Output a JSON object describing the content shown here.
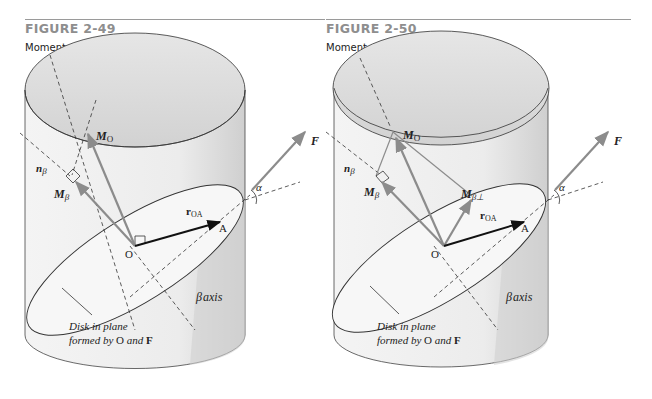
{
  "figures": [
    {
      "number": "FIGURE 2-49",
      "caption_prefix": "Moment about ",
      "caption_symbol": "β",
      "caption_suffix": " axis",
      "labels": {
        "M_O_main": "M",
        "M_O_sub": "O",
        "n_beta_main": "n",
        "n_beta_sub": "β",
        "M_beta_main": "M",
        "M_beta_sub": "β",
        "r_OA_main": "r",
        "r_OA_sub": "OA",
        "point_O": "O",
        "point_A": "A",
        "force_F": "F",
        "angle_alpha": "α",
        "beta_axis_symbol": "β",
        "beta_axis_text": "axis",
        "disk_line1": "Disk in plane",
        "disk_line2_prefix": "formed by ",
        "disk_line2_O": "O",
        "disk_line2_mid": " and ",
        "disk_line2_F": "F"
      }
    },
    {
      "number": "FIGURE 2-50",
      "caption_prefix": "Moment perpendicular to ",
      "caption_symbol": "β",
      "caption_suffix": " axis",
      "labels": {
        "M_O_main": "M",
        "M_O_sub": "O",
        "n_beta_main": "n",
        "n_beta_sub": "β",
        "M_beta_main": "M",
        "M_beta_sub": "β",
        "M_beta_perp_main": "M",
        "M_beta_perp_sub": "β⊥",
        "r_OA_main": "r",
        "r_OA_sub": "OA",
        "point_O": "O",
        "point_A": "A",
        "force_F": "F",
        "angle_alpha": "α",
        "beta_axis_symbol": "β",
        "beta_axis_text": "axis",
        "disk_line1": "Disk in plane",
        "disk_line2_prefix": "formed by ",
        "disk_line2_O": "O",
        "disk_line2_mid": " and ",
        "disk_line2_F": "F"
      }
    }
  ],
  "colors": {
    "figure_number": "#8e8e8e",
    "vector_gray": "#8c8c8c",
    "position_vector": "#111111",
    "cylinder_fill_light": "#f2f2f2",
    "cylinder_fill_dark": "#c8c8c8"
  }
}
